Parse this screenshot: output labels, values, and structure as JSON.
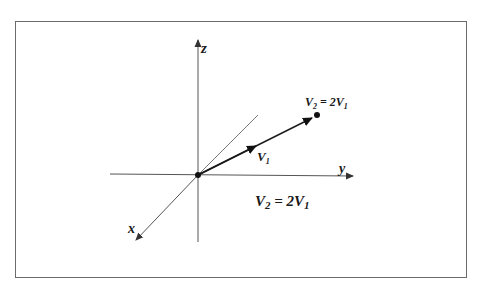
{
  "diagram": {
    "axes": {
      "x_label": "x",
      "y_label": "y",
      "z_label": "z"
    },
    "vectors": {
      "v1_label": "V",
      "v1_sub": "1",
      "v2_point_label_main": "V",
      "v2_point_label_sub": "2",
      "v2_point_label_eq": " = 2V",
      "v2_point_label_sub2": "1"
    },
    "equation": {
      "lhs": "V",
      "lhs_sub": "2",
      "mid": " = 2V",
      "rhs_sub": "1"
    },
    "colors": {
      "line": "#555555",
      "vector": "#1a1a1a",
      "frame": "#6b6b6b"
    }
  }
}
